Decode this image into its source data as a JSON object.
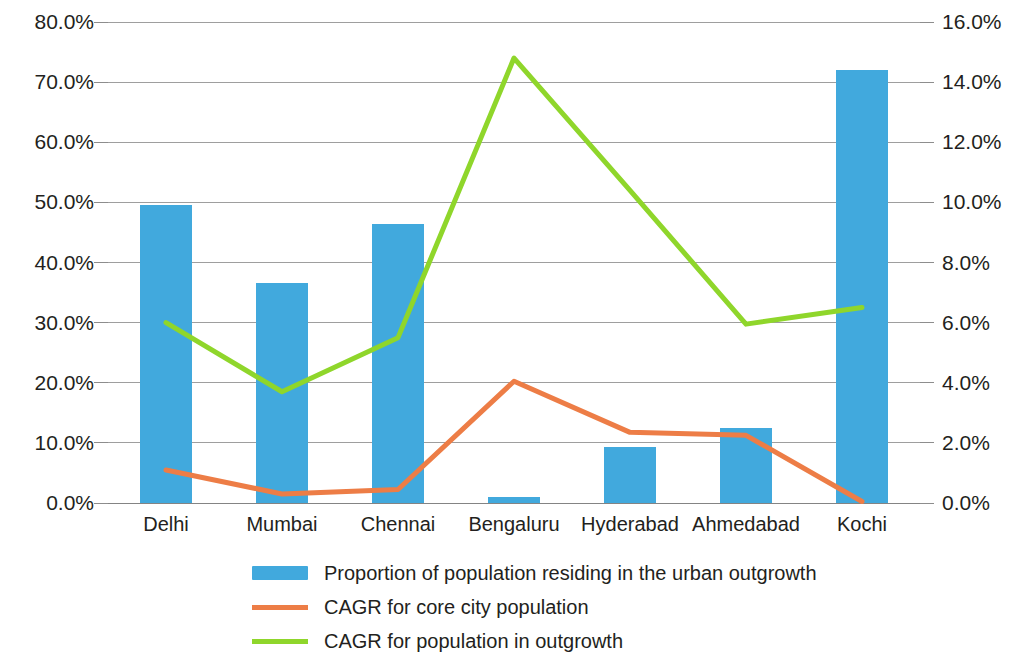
{
  "chart_data": {
    "type": "bar",
    "title": "",
    "subtitle": "",
    "xlabel": "",
    "ylabel": "",
    "categories": [
      "Delhi",
      "Mumbai",
      "Chennai",
      "Bengaluru",
      "Hyderabad",
      "Ahmedabad",
      "Kochi"
    ],
    "grid": true,
    "legend_position": "bottom",
    "axes": {
      "left": {
        "ylabel": "",
        "ylim": [
          0,
          80
        ],
        "tick_step": 10,
        "tick_labels": [
          "0.0%",
          "10.0%",
          "20.0%",
          "30.0%",
          "40.0%",
          "50.0%",
          "60.0%",
          "70.0%",
          "80.0%"
        ],
        "tick_values": [
          0,
          10,
          20,
          30,
          40,
          50,
          60,
          70,
          80
        ]
      },
      "right": {
        "ylabel": "",
        "ylim": [
          0,
          16
        ],
        "tick_step": 2,
        "tick_labels": [
          "0.0%",
          "2.0%",
          "4.0%",
          "6.0%",
          "8.0%",
          "10.0%",
          "12.0%",
          "14.0%",
          "16.0%"
        ],
        "tick_values": [
          0,
          2,
          4,
          6,
          8,
          10,
          12,
          14,
          16
        ]
      }
    },
    "series": [
      {
        "name": "Proportion of population residing in the urban outgrowth",
        "kind": "bar",
        "axis": "left",
        "color": "#41a9dd",
        "values": [
          49.6,
          36.6,
          46.4,
          1.0,
          9.3,
          12.5,
          72.0
        ]
      },
      {
        "name": "CAGR for core city population",
        "kind": "line",
        "axis": "right",
        "color": "#ed7d46",
        "values": [
          1.1,
          0.3,
          0.45,
          4.05,
          2.35,
          2.25,
          0.05
        ]
      },
      {
        "name": "CAGR for population in outgrowth",
        "kind": "line",
        "axis": "right",
        "color": "#8fd62b",
        "values": [
          6.0,
          3.7,
          5.5,
          14.8,
          10.4,
          5.95,
          6.5
        ]
      }
    ]
  },
  "legend": {
    "items": [
      {
        "label": "Proportion of population residing in the urban outgrowth",
        "marker": "swatch",
        "color": "#41a9dd"
      },
      {
        "label": "CAGR for core city population",
        "marker": "line",
        "color": "#ed7d46"
      },
      {
        "label": "CAGR for population in outgrowth",
        "marker": "line",
        "color": "#8fd62b"
      }
    ]
  }
}
